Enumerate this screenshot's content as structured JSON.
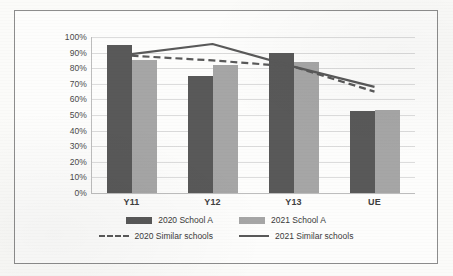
{
  "chart_data": {
    "type": "bar",
    "title": "",
    "xlabel": "",
    "ylabel": "",
    "categories": [
      "Y11",
      "Y12",
      "Y13",
      "UE"
    ],
    "ylim": [
      0,
      100
    ],
    "ytick_labels": [
      "100%",
      "90%",
      "80%",
      "70%",
      "60%",
      "50%",
      "40%",
      "30%",
      "20%",
      "10%",
      "0%"
    ],
    "ytick_values": [
      100,
      90,
      80,
      70,
      60,
      50,
      40,
      30,
      20,
      10,
      0
    ],
    "grid": true,
    "legend_position": "bottom",
    "series": [
      {
        "name": "2020 School A",
        "type": "bar",
        "color": "#595959",
        "values": [
          95,
          75,
          89.5,
          52.5
        ]
      },
      {
        "name": "2021 School A",
        "type": "bar",
        "color": "#a6a6a6",
        "values": [
          85,
          82,
          84,
          53.5
        ]
      },
      {
        "name": "2020 Similar schools",
        "type": "line",
        "color": "#595959",
        "style": "dashed",
        "values": [
          88,
          85,
          81,
          65
        ]
      },
      {
        "name": "2021 Similar schools",
        "type": "line",
        "color": "#595959",
        "style": "solid",
        "values": [
          89,
          95.5,
          81,
          68
        ]
      }
    ]
  },
  "colors": {
    "series_2020": "#595959",
    "series_2021": "#a6a6a6",
    "grid": "#dcdcdc",
    "frame": "#8d8d8d"
  }
}
